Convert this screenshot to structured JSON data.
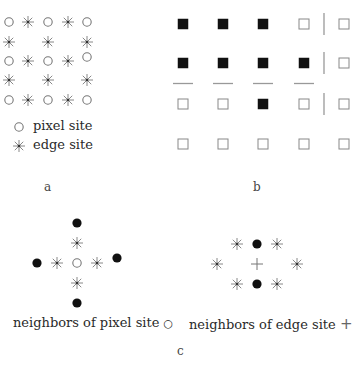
{
  "panel_a": {
    "label": "a",
    "colors": {
      "symbol": "#777777",
      "dot": "#333333"
    },
    "grid": [
      [
        "pixel",
        "edge",
        "pixel",
        "edge",
        "pixel"
      ],
      [
        "edge",
        "",
        "edge",
        "",
        "edge"
      ],
      [
        "pixel",
        "edge",
        "pixel",
        "edge",
        "pixel"
      ],
      [
        "edge",
        "",
        "edge",
        "",
        "edge"
      ],
      [
        "pixel",
        "edge",
        "pixel",
        "edge",
        "pixel"
      ]
    ],
    "legend": [
      {
        "symbol": "pixel",
        "text": "pixel site"
      },
      {
        "symbol": "edge",
        "text": "edge site"
      }
    ]
  },
  "panel_b": {
    "label": "b",
    "colors": {
      "filled": "#111111",
      "empty_stroke": "#888888",
      "line": "#999999"
    },
    "grid": [
      [
        1,
        1,
        1,
        0,
        0
      ],
      [
        1,
        1,
        1,
        1,
        0
      ],
      [
        0,
        0,
        1,
        0,
        0
      ],
      [
        0,
        0,
        0,
        0,
        0
      ]
    ],
    "vertical_edges": [
      {
        "row": 0,
        "between_cols": [
          3,
          4
        ]
      },
      {
        "row": 1,
        "between_cols": [
          3,
          4
        ]
      },
      {
        "row": 2,
        "between_cols": [
          3,
          4
        ]
      }
    ],
    "horizontal_edges": [
      {
        "between_rows": [
          1,
          2
        ],
        "col": 0
      },
      {
        "between_rows": [
          1,
          2
        ],
        "col": 1
      },
      {
        "between_rows": [
          1,
          2
        ],
        "col": 2
      },
      {
        "between_rows": [
          1,
          2
        ],
        "col": 3
      }
    ]
  },
  "panel_c": {
    "label": "c",
    "pixel_neighbors": {
      "caption": "neighbors of pixel site",
      "caption_symbol": "○",
      "center": "pixel",
      "items": [
        {
          "type": "dot",
          "dx": 0,
          "dy": -2
        },
        {
          "type": "edge",
          "dx": 0,
          "dy": -1
        },
        {
          "type": "dot",
          "dx": -2,
          "dy": 0
        },
        {
          "type": "edge",
          "dx": -1,
          "dy": 0
        },
        {
          "type": "edge",
          "dx": 1,
          "dy": 0
        },
        {
          "type": "dot",
          "dx": 2,
          "dy": -0.25
        },
        {
          "type": "edge",
          "dx": 0,
          "dy": 1
        },
        {
          "type": "dot",
          "dx": 0,
          "dy": 2
        }
      ]
    },
    "edge_neighbors": {
      "caption": "neighbors of edge site",
      "caption_symbol": "+",
      "center": "plus",
      "items": [
        {
          "type": "edge",
          "dx": -1,
          "dy": -1
        },
        {
          "type": "dot",
          "dx": 0,
          "dy": -1
        },
        {
          "type": "edge",
          "dx": 1,
          "dy": -1
        },
        {
          "type": "edge",
          "dx": -2,
          "dy": 0
        },
        {
          "type": "edge",
          "dx": 2,
          "dy": 0
        },
        {
          "type": "edge",
          "dx": -1,
          "dy": 1
        },
        {
          "type": "dot",
          "dx": 0,
          "dy": 1
        },
        {
          "type": "edge",
          "dx": 1,
          "dy": 1
        }
      ]
    }
  }
}
